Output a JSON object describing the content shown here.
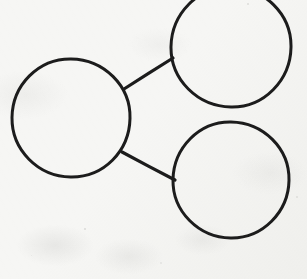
{
  "image": {
    "kind": "hand-drawn-diagram",
    "width": 307,
    "height": 279,
    "background_color": "#f6f6f4",
    "ink_color": "#1c1c1c",
    "description": "Three hand-drawn circles on scanned off-white paper; the large left circle connects by a straight line to an upper-right circle and by a second straight line to a lower-right circle."
  },
  "diagram": {
    "stroke_color": "#1c1c1c",
    "stroke_width": 3,
    "fill": "none",
    "nodes": [
      {
        "id": "left-circle",
        "label": "",
        "shape": "circle",
        "cx": 71,
        "cy": 118,
        "r": 59,
        "clipped": false
      },
      {
        "id": "top-right-circle",
        "label": "",
        "shape": "circle",
        "cx": 231,
        "cy": 47,
        "r": 60,
        "clipped": true
      },
      {
        "id": "bottom-right-circle",
        "label": "",
        "shape": "circle",
        "cx": 231,
        "cy": 180,
        "r": 58,
        "clipped": false
      }
    ],
    "edges": [
      {
        "id": "edge-left-to-top-right",
        "from": "left-circle",
        "to": "top-right-circle",
        "x1": 124,
        "y1": 89,
        "x2": 173,
        "y2": 58
      },
      {
        "id": "edge-left-to-bottom-right",
        "from": "left-circle",
        "to": "bottom-right-circle",
        "x1": 122,
        "y1": 152,
        "x2": 175,
        "y2": 180
      }
    ]
  },
  "specks": [
    {
      "x": 84,
      "y": 228,
      "size": 2.0,
      "opacity": 0.45
    },
    {
      "x": 247,
      "y": 3,
      "size": 2.4,
      "opacity": 0.4
    },
    {
      "x": 296,
      "y": 196,
      "size": 1.6,
      "opacity": 0.3
    },
    {
      "x": 31,
      "y": 255,
      "size": 1.4,
      "opacity": 0.26
    },
    {
      "x": 160,
      "y": 262,
      "size": 1.5,
      "opacity": 0.24
    }
  ]
}
